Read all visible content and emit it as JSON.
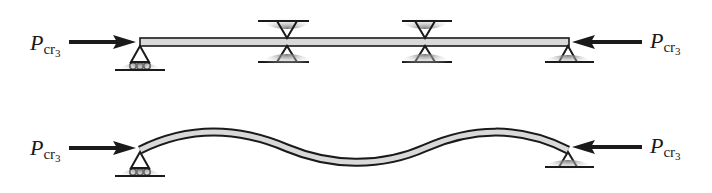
{
  "figure": {
    "colors": {
      "ink": "#1a1a1a",
      "beam_fill": "#d9d9d9",
      "ground_shadow": "#7a7a7a"
    }
  },
  "top_panel": {
    "name": "braced-column",
    "left_load": {
      "symbol": "P",
      "subscript": "cr",
      "subsub": "3"
    },
    "right_load": {
      "symbol": "P",
      "subscript": "cr",
      "subsub": "3"
    },
    "supports": [
      {
        "type": "pin-roller",
        "position": "left-end"
      },
      {
        "type": "lateral-brace",
        "position": "one-third"
      },
      {
        "type": "lateral-brace",
        "position": "two-thirds"
      },
      {
        "type": "pin",
        "position": "right-end"
      }
    ]
  },
  "bottom_panel": {
    "name": "buckled-mode-shape",
    "left_load": {
      "symbol": "P",
      "subscript": "cr",
      "subsub": "3"
    },
    "right_load": {
      "symbol": "P",
      "subscript": "cr",
      "subsub": "3"
    },
    "mode_half_waves": 3,
    "supports": [
      {
        "type": "pin-roller",
        "position": "left-end"
      },
      {
        "type": "pin",
        "position": "right-end"
      }
    ]
  }
}
